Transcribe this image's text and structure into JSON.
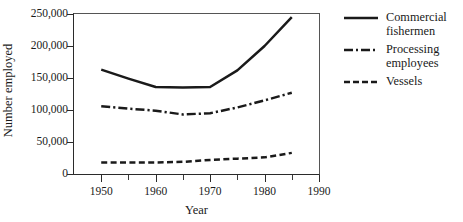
{
  "chart_data": {
    "type": "line",
    "title": "",
    "xlabel": "Year",
    "ylabel": "Number employed",
    "xlim": [
      1945,
      1990
    ],
    "ylim": [
      0,
      250000
    ],
    "xticks": [
      1950,
      1960,
      1970,
      1980,
      1990
    ],
    "xtick_labels": [
      "1950",
      "1960",
      "1970",
      "1980",
      "1990"
    ],
    "xticks_minor": [
      1955,
      1965,
      1975,
      1985
    ],
    "yticks": [
      0,
      50000,
      100000,
      150000,
      200000,
      250000
    ],
    "ytick_labels": [
      "0",
      "50,000",
      "100,000",
      "150,000",
      "200,000",
      "250,000"
    ],
    "grid": false,
    "legend_position": "right",
    "series": [
      {
        "name": "Commercial fishermen",
        "style": "solid",
        "x": [
          1950,
          1955,
          1960,
          1965,
          1970,
          1975,
          1980,
          1985
        ],
        "values": [
          163000,
          149000,
          136000,
          135000,
          136000,
          162000,
          200000,
          245000
        ]
      },
      {
        "name": "Processing employees",
        "style": "dash-dot",
        "x": [
          1950,
          1955,
          1960,
          1965,
          1970,
          1975,
          1980,
          1985
        ],
        "values": [
          106000,
          102000,
          99000,
          93000,
          95000,
          104000,
          115000,
          127000
        ]
      },
      {
        "name": "Vessels",
        "style": "dashed",
        "x": [
          1950,
          1955,
          1960,
          1965,
          1970,
          1975,
          1980,
          1985
        ],
        "values": [
          18000,
          18000,
          18000,
          19000,
          22000,
          24000,
          26000,
          33000
        ]
      }
    ]
  },
  "legend": {
    "items": [
      {
        "label_line1": "Commercial",
        "label_line2": "fishermen",
        "style": "solid"
      },
      {
        "label_line1": "Processing",
        "label_line2": "employees",
        "style": "dash-dot"
      },
      {
        "label_line1": "Vessels",
        "label_line2": "",
        "style": "dashed"
      }
    ]
  },
  "colors": {
    "line": "#1a1a1a",
    "axis": "#2b2b2b",
    "frame": "#555555",
    "background": "#ffffff"
  }
}
